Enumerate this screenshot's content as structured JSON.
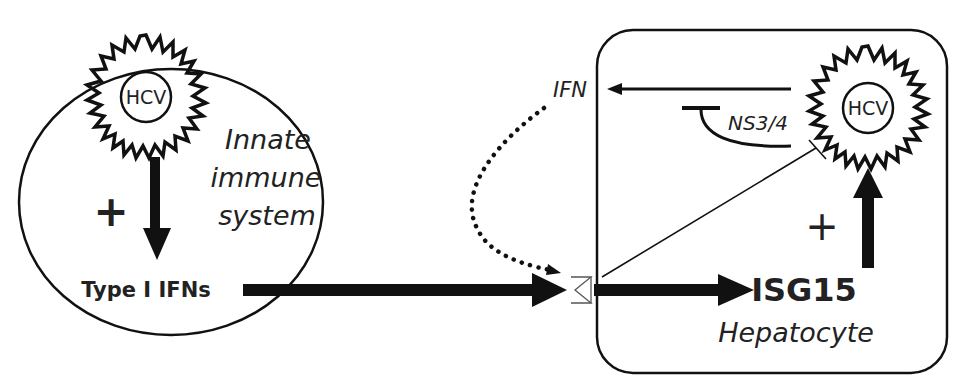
{
  "diagram": {
    "left_compartment": {
      "label_line1": "Innate",
      "label_line2": "immune",
      "label_line3": "system",
      "virus_label": "HCV",
      "plus_sign": "+",
      "output_label": "Type I IFNs"
    },
    "right_compartment": {
      "cell_label": "Hepatocyte",
      "virus_label": "HCV",
      "protease_label": "NS3/4",
      "ifn_label": "IFN",
      "isg_label": "ISG15",
      "plus_sign": "+"
    },
    "edges": [
      {
        "from": "HCV (innate)",
        "to": "Type I IFNs",
        "type": "activation",
        "style": "solid-thick"
      },
      {
        "from": "Type I IFNs",
        "to": "receptor",
        "type": "activation",
        "style": "solid-thick"
      },
      {
        "from": "receptor",
        "to": "ISG15",
        "type": "activation",
        "style": "solid-thick"
      },
      {
        "from": "ISG15",
        "to": "HCV (hepatocyte)",
        "type": "activation",
        "style": "solid-thick"
      },
      {
        "from": "receptor",
        "to": "HCV (hepatocyte)",
        "type": "inhibition",
        "style": "thin"
      },
      {
        "from": "HCV (hepatocyte)",
        "to": "IFN",
        "type": "activation",
        "style": "solid"
      },
      {
        "from": "NS3/4",
        "to": "IFN pathway",
        "type": "inhibition",
        "style": "solid-curve"
      },
      {
        "from": "IFN",
        "to": "receptor",
        "type": "activation",
        "style": "dotted"
      }
    ]
  }
}
